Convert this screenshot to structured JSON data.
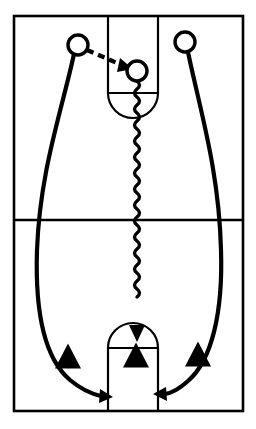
{
  "diagram": {
    "type": "basketball-play",
    "colors": {
      "court_line": "#000000",
      "player_fill": "#ffffff",
      "player_stroke": "#000000",
      "defender_fill": "#000000",
      "movement_line": "#000000",
      "background": "#ffffff"
    },
    "court": {
      "name": "full-court-outline",
      "x": 14,
      "y": 16,
      "width": 229,
      "height": 395,
      "midcourt_line_y": 220,
      "keys": [
        {
          "name": "top-key",
          "label": "Top Free Throw Lane",
          "x": 108,
          "y": 16,
          "width": 50,
          "height": 77,
          "free_throw_line_y": 93,
          "arc_direction": "down"
        },
        {
          "name": "bottom-key",
          "label": "Bottom Free Throw Lane",
          "x": 108,
          "y": 348,
          "width": 50,
          "height": 63,
          "free_throw_line_y": 348,
          "arc_direction": "up"
        }
      ]
    },
    "players": [
      {
        "name": "player-left-wing",
        "label": "Left Wing Player",
        "cx": 78,
        "cy": 45,
        "r": 10,
        "role": "passer"
      },
      {
        "name": "player-ball-handler",
        "label": "Ball Handler",
        "cx": 137,
        "cy": 71,
        "r": 10,
        "role": "receiver-dribbler"
      },
      {
        "name": "player-right-wing",
        "label": "Right Wing Player",
        "cx": 185,
        "cy": 42,
        "r": 10,
        "role": "cutter"
      }
    ],
    "defenders": [
      {
        "name": "defender-left",
        "label": "Defender Left",
        "cx": 68,
        "cy": 356
      },
      {
        "name": "defender-middle",
        "label": "Defender Middle",
        "cx": 136,
        "cy": 355
      },
      {
        "name": "defender-right",
        "label": "Defender Right",
        "cx": 198,
        "cy": 354
      }
    ],
    "movements": [
      {
        "name": "pass-left-to-center",
        "label": "Pass",
        "style": "dashed",
        "from": "player-left-wing",
        "to": "player-ball-handler",
        "has_arrowhead": true
      },
      {
        "name": "dribble-down-middle",
        "label": "Dribble",
        "style": "squiggle",
        "from": "player-ball-handler",
        "to": "bottom-key",
        "has_arrowhead": true
      },
      {
        "name": "cut-left-baseline",
        "label": "Cut Left Side",
        "style": "solid",
        "from": "player-left-wing",
        "to": "bottom-left-block",
        "has_arrowhead": true
      },
      {
        "name": "cut-right-baseline",
        "label": "Cut Right Side",
        "style": "solid",
        "from": "player-right-wing",
        "to": "bottom-right-block",
        "has_arrowhead": true
      }
    ]
  }
}
